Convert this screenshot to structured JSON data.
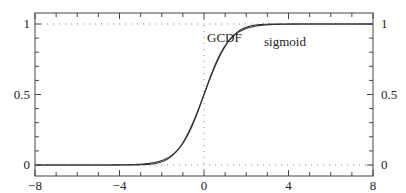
{
  "chart_data": {
    "type": "line",
    "title": "",
    "xlabel": "",
    "ylabel": "",
    "xlim": [
      -8,
      8
    ],
    "ylim": [
      0,
      1
    ],
    "x_ticks": [
      -8,
      -4,
      0,
      4,
      8
    ],
    "x_tick_labels": [
      "−8",
      "−4",
      "0",
      "4",
      "8"
    ],
    "x_minor_step": 1,
    "y_ticks": [
      0,
      0.5,
      1
    ],
    "y_tick_labels": [
      "0",
      "0.5",
      "1"
    ],
    "y_minor_step": 0.1,
    "y_labels_both_sides": true,
    "reference_lines": [
      {
        "orientation": "horizontal",
        "value": 0,
        "style": "dotted"
      },
      {
        "orientation": "horizontal",
        "value": 1,
        "style": "dotted"
      },
      {
        "orientation": "vertical",
        "value": 0,
        "style": "dotted"
      }
    ],
    "grid": false,
    "legend": "inline annotations",
    "series": [
      {
        "name": "GCDF",
        "function": "standard normal CDF",
        "label_pos": [
          0.35,
          0.9
        ],
        "x": [
          -8,
          -6,
          -4,
          -3,
          -2,
          -1.5,
          -1,
          -0.5,
          0,
          0.5,
          1,
          1.5,
          2,
          3,
          4,
          6,
          8
        ],
        "values": [
          0.0,
          0.0,
          0.0,
          0.001,
          0.023,
          0.067,
          0.159,
          0.309,
          0.5,
          0.691,
          0.841,
          0.933,
          0.977,
          0.999,
          1.0,
          1.0,
          1.0
        ]
      },
      {
        "name": "sigmoid",
        "function": "1/(1+exp(-1.702x))",
        "label_pos": [
          2.1,
          0.85
        ],
        "x": [
          -8,
          -6,
          -4,
          -3,
          -2,
          -1.5,
          -1,
          -0.5,
          0,
          0.5,
          1,
          1.5,
          2,
          3,
          4,
          6,
          8
        ],
        "values": [
          0.0,
          0.0,
          0.001,
          0.006,
          0.032,
          0.072,
          0.154,
          0.3,
          0.5,
          0.7,
          0.846,
          0.928,
          0.968,
          0.994,
          0.999,
          1.0,
          1.0
        ]
      }
    ]
  },
  "annotations": {
    "gcdf_label": "GCDF",
    "sigmoid_label": "sigmoid"
  },
  "colors": {
    "line": "#333333",
    "frame": "#444444",
    "dotted": "#888888"
  }
}
